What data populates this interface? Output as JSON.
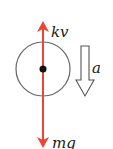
{
  "diagram": {
    "forces": [
      {
        "label": "kv",
        "direction": "up",
        "color": "#ee4433"
      },
      {
        "label": "mg",
        "direction": "down",
        "color": "#ee4433"
      }
    ],
    "acceleration": {
      "label": "a",
      "direction": "down",
      "style": "hollow-arrow"
    },
    "body": {
      "shape": "circle",
      "stroke": "#555555",
      "center_dot": "#111111"
    }
  }
}
